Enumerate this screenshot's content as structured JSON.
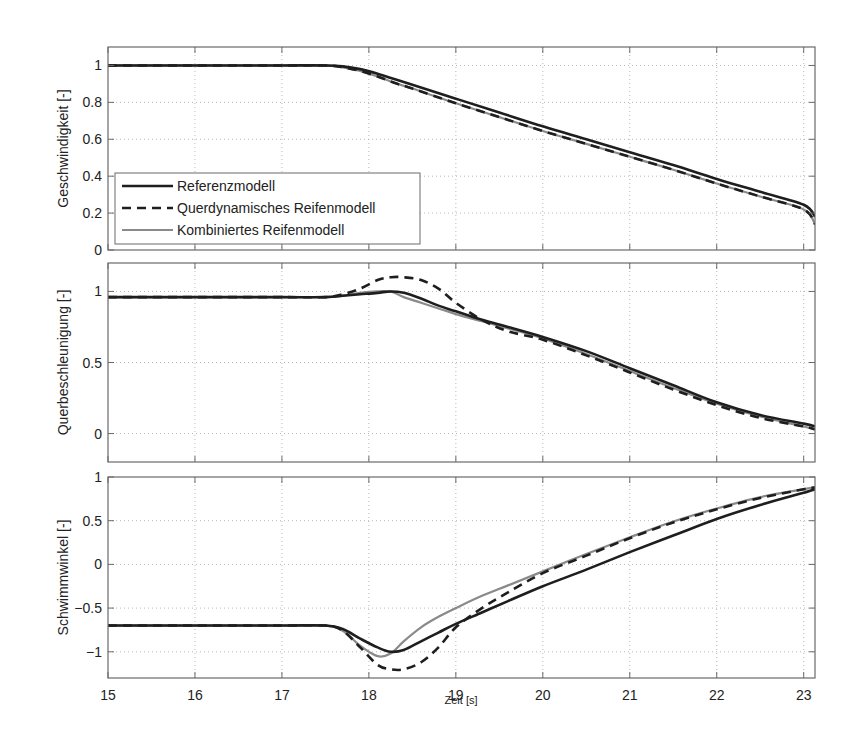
{
  "figure": {
    "xlabel": "Zeit [s]",
    "legend": [
      {
        "label": "Referenzmodell",
        "style": "solid",
        "color": "#1e1e1e",
        "width": 2.6
      },
      {
        "label": "Querdynamisches Reifenmodell",
        "style": "dashed",
        "color": "#1e1e1e",
        "width": 2.6
      },
      {
        "label": "Kombiniertes Reifenmodell",
        "style": "solid",
        "color": "#8a8a8a",
        "width": 2.2
      }
    ]
  },
  "chart_data": [
    {
      "type": "line",
      "title": "",
      "xlabel": "Zeit [s]",
      "ylabel": "Geschwindigkeit [-]",
      "xlim": [
        15,
        23.13
      ],
      "ylim": [
        0,
        1.1
      ],
      "xticks": [
        15,
        16,
        17,
        18,
        19,
        20,
        21,
        22,
        23
      ],
      "yticks": [
        0,
        0.2,
        0.4,
        0.6,
        0.8,
        1
      ],
      "ytick_labels": [
        "0",
        "0.2",
        "0.4",
        "0.6",
        "0.8",
        "1"
      ],
      "grid": true,
      "legend_position": "lower left",
      "x": [
        15,
        16,
        17,
        17.5,
        17.7,
        17.9,
        18.1,
        18.3,
        18.5,
        19,
        19.5,
        20,
        20.5,
        21,
        21.5,
        22,
        22.5,
        23,
        23.13
      ],
      "series": [
        {
          "name": "Referenzmodell",
          "values": [
            1,
            1,
            1,
            1,
            0.995,
            0.98,
            0.955,
            0.925,
            0.895,
            0.82,
            0.745,
            0.67,
            0.6,
            0.53,
            0.46,
            0.385,
            0.315,
            0.245,
            0.18
          ]
        },
        {
          "name": "Querdynamisches Reifenmodell",
          "values": [
            1,
            1,
            1,
            1,
            0.99,
            0.97,
            0.94,
            0.905,
            0.875,
            0.795,
            0.72,
            0.645,
            0.575,
            0.505,
            0.435,
            0.36,
            0.29,
            0.22,
            0.14
          ]
        },
        {
          "name": "Kombiniertes Reifenmodell",
          "values": [
            1,
            1,
            1,
            1,
            0.99,
            0.97,
            0.94,
            0.905,
            0.875,
            0.795,
            0.72,
            0.645,
            0.575,
            0.505,
            0.435,
            0.36,
            0.29,
            0.22,
            0.14
          ]
        }
      ]
    },
    {
      "type": "line",
      "title": "",
      "xlabel": "Zeit [s]",
      "ylabel": "Querbeschleunigung [-]",
      "xlim": [
        15,
        23.13
      ],
      "ylim": [
        -0.2,
        1.2
      ],
      "xticks": [
        15,
        16,
        17,
        18,
        19,
        20,
        21,
        22,
        23
      ],
      "yticks": [
        0,
        0.5,
        1
      ],
      "ytick_labels": [
        "0",
        "0.5",
        "1"
      ],
      "grid": true,
      "x": [
        15,
        16,
        17,
        17.5,
        17.7,
        17.9,
        18.1,
        18.25,
        18.4,
        18.6,
        18.8,
        19,
        19.3,
        19.6,
        20,
        20.5,
        21,
        21.5,
        22,
        22.5,
        23,
        23.13
      ],
      "series": [
        {
          "name": "Referenzmodell",
          "values": [
            0.96,
            0.96,
            0.96,
            0.96,
            0.97,
            0.98,
            0.99,
            1.0,
            0.99,
            0.95,
            0.9,
            0.86,
            0.8,
            0.75,
            0.68,
            0.58,
            0.46,
            0.34,
            0.22,
            0.13,
            0.07,
            0.05
          ]
        },
        {
          "name": "Querdynamisches Reifenmodell",
          "values": [
            0.96,
            0.96,
            0.96,
            0.96,
            0.98,
            1.02,
            1.08,
            1.1,
            1.1,
            1.08,
            1.02,
            0.92,
            0.8,
            0.72,
            0.66,
            0.55,
            0.43,
            0.31,
            0.2,
            0.11,
            0.05,
            0.03
          ]
        },
        {
          "name": "Kombiniertes Reifenmodell",
          "values": [
            0.96,
            0.96,
            0.96,
            0.96,
            0.97,
            0.99,
            1.0,
            1.0,
            0.96,
            0.92,
            0.88,
            0.84,
            0.79,
            0.74,
            0.67,
            0.56,
            0.44,
            0.32,
            0.21,
            0.12,
            0.05,
            0.03
          ]
        }
      ]
    },
    {
      "type": "line",
      "title": "",
      "xlabel": "Zeit [s]",
      "ylabel": "Schwimmwinkel [-]",
      "xlim": [
        15,
        23.13
      ],
      "ylim": [
        -1.3,
        1
      ],
      "xticks": [
        15,
        16,
        17,
        18,
        19,
        20,
        21,
        22,
        23
      ],
      "xtick_labels": [
        "15",
        "16",
        "17",
        "18",
        "19",
        "20",
        "21",
        "22",
        "23"
      ],
      "yticks": [
        -1,
        -0.5,
        0,
        0.5,
        1
      ],
      "ytick_labels": [
        "−1",
        "−0.5",
        "0",
        "0.5",
        "1"
      ],
      "grid": true,
      "x": [
        15,
        16,
        17,
        17.5,
        17.7,
        17.9,
        18.1,
        18.25,
        18.4,
        18.6,
        18.8,
        19,
        19.3,
        19.6,
        20,
        20.5,
        21,
        21.5,
        22,
        22.5,
        23,
        23.13
      ],
      "series": [
        {
          "name": "Referenzmodell",
          "values": [
            -0.7,
            -0.7,
            -0.7,
            -0.7,
            -0.74,
            -0.85,
            -0.95,
            -1.0,
            -0.98,
            -0.88,
            -0.78,
            -0.68,
            -0.55,
            -0.42,
            -0.25,
            -0.06,
            0.14,
            0.33,
            0.52,
            0.68,
            0.82,
            0.86
          ]
        },
        {
          "name": "Querdynamisches Reifenmodell",
          "values": [
            -0.7,
            -0.7,
            -0.7,
            -0.7,
            -0.76,
            -0.95,
            -1.15,
            -1.2,
            -1.2,
            -1.12,
            -0.95,
            -0.72,
            -0.5,
            -0.32,
            -0.1,
            0.1,
            0.3,
            0.48,
            0.63,
            0.76,
            0.86,
            0.88
          ]
        },
        {
          "name": "Kombiniertes Reifenmodell",
          "values": [
            -0.7,
            -0.7,
            -0.7,
            -0.7,
            -0.76,
            -0.93,
            -1.05,
            -1.02,
            -0.88,
            -0.72,
            -0.6,
            -0.5,
            -0.36,
            -0.24,
            -0.08,
            0.12,
            0.31,
            0.49,
            0.64,
            0.77,
            0.86,
            0.88
          ]
        }
      ]
    }
  ]
}
